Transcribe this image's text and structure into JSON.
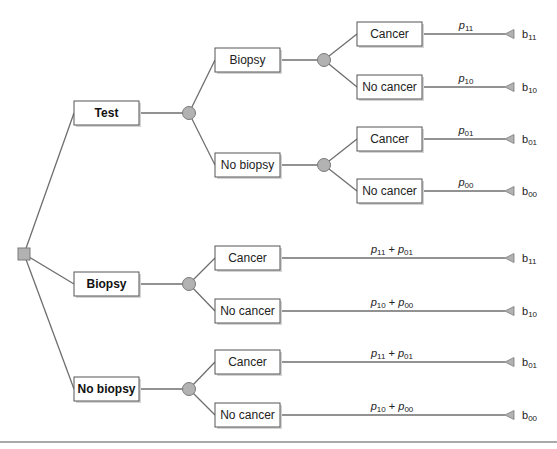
{
  "diagram": {
    "type": "decision-tree",
    "colors": {
      "line": "#6e6e6e",
      "node_fill": "#b2b2b2",
      "box_border": "#555555"
    },
    "root": {
      "type": "decision",
      "shape": "square"
    },
    "decisions": [
      {
        "label": "Test",
        "chance": [
          {
            "label": "Biopsy",
            "outcomes": [
              {
                "label": "Cancer",
                "prob_base": "p",
                "prob_sub": "11",
                "payoff_base": "b",
                "payoff_sub": "11"
              },
              {
                "label": "No cancer",
                "prob_base": "p",
                "prob_sub": "10",
                "payoff_base": "b",
                "payoff_sub": "10"
              }
            ]
          },
          {
            "label": "No biopsy",
            "outcomes": [
              {
                "label": "Cancer",
                "prob_base": "p",
                "prob_sub": "01",
                "payoff_base": "b",
                "payoff_sub": "01"
              },
              {
                "label": "No cancer",
                "prob_base": "p",
                "prob_sub": "00",
                "payoff_base": "b",
                "payoff_sub": "00"
              }
            ]
          }
        ]
      },
      {
        "label": "Biopsy",
        "outcomes": [
          {
            "label": "Cancer",
            "prob_a": "p",
            "prob_a_sub": "11",
            "plus": " + ",
            "prob_b": "p",
            "prob_b_sub": "01",
            "payoff_base": "b",
            "payoff_sub": "11"
          },
          {
            "label": "No cancer",
            "prob_a": "p",
            "prob_a_sub": "10",
            "plus": " + ",
            "prob_b": "p",
            "prob_b_sub": "00",
            "payoff_base": "b",
            "payoff_sub": "10"
          }
        ]
      },
      {
        "label": "No biopsy",
        "outcomes": [
          {
            "label": "Cancer",
            "prob_a": "p",
            "prob_a_sub": "11",
            "plus": " + ",
            "prob_b": "p",
            "prob_b_sub": "01",
            "payoff_base": "b",
            "payoff_sub": "01"
          },
          {
            "label": "No cancer",
            "prob_a": "p",
            "prob_a_sub": "10",
            "plus": " + ",
            "prob_b": "p",
            "prob_b_sub": "00",
            "payoff_base": "b",
            "payoff_sub": "00"
          }
        ]
      }
    ]
  }
}
